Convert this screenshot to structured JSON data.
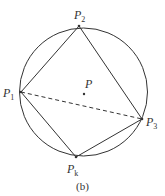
{
  "figure": {
    "caption": "(b)",
    "center_label": "P",
    "points": [
      {
        "id": "P1",
        "letter": "P",
        "sub": "1"
      },
      {
        "id": "P2",
        "letter": "P",
        "sub": "2"
      },
      {
        "id": "P3",
        "letter": "P",
        "sub": "3"
      },
      {
        "id": "Pk",
        "letter": "P",
        "sub": "k"
      }
    ],
    "edges": [
      {
        "from": "P1",
        "to": "P2",
        "style": "solid"
      },
      {
        "from": "P2",
        "to": "P3",
        "style": "solid"
      },
      {
        "from": "P3",
        "to": "Pk",
        "style": "solid"
      },
      {
        "from": "Pk",
        "to": "P1",
        "style": "solid"
      },
      {
        "from": "P1",
        "to": "P3",
        "style": "dashed"
      }
    ],
    "colors": {
      "stroke": "#333333",
      "background": "#ffffff"
    }
  }
}
